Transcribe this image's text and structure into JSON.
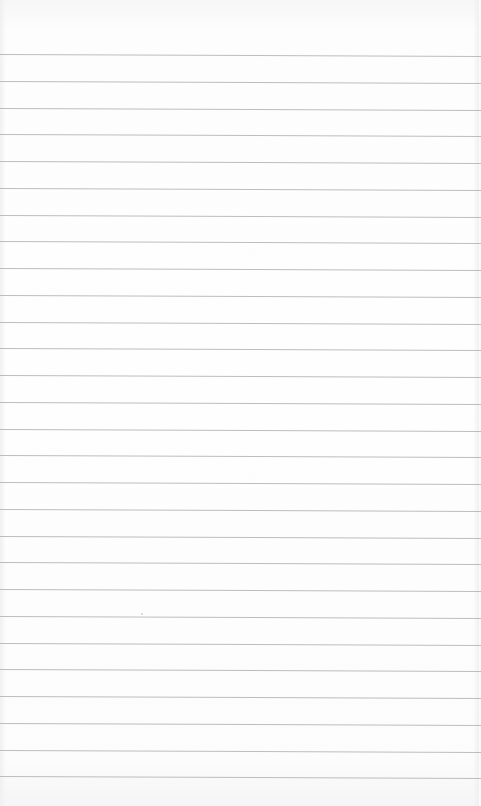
{
  "scene": {
    "description": "Blank sheet of ruled (lined) paper",
    "background_color": "#fbfbfb",
    "rule_color": "#bdbdbd",
    "rule_count": 28,
    "first_rule_y": 55,
    "rule_spacing": 26.75
  }
}
